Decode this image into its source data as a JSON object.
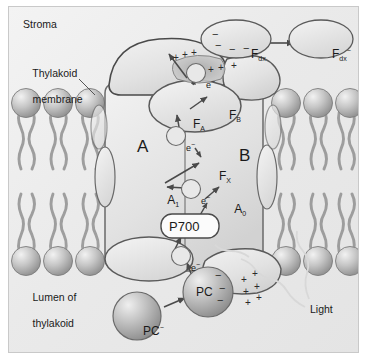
{
  "figure": {
    "type": "biological-diagram",
    "background_color": "#ebebeb",
    "frame_color": "#c9c9c9"
  },
  "region_labels": [
    {
      "id": "stroma",
      "text": "Stroma",
      "x": 14,
      "y": 18
    },
    {
      "id": "thylakoid-membrane",
      "line1": "Thylakoid",
      "line2": "membrane",
      "x": 6,
      "y": 53
    },
    {
      "id": "lumen",
      "line1": "Lumen of",
      "line2": "thylakoid",
      "x": 6,
      "y": 277
    },
    {
      "id": "light",
      "text": "Light",
      "x": 300,
      "y": 303
    }
  ],
  "subunits": [
    {
      "id": "subunit-a",
      "label": "A",
      "x": 131,
      "y": 139
    },
    {
      "id": "subunit-b",
      "label": "B",
      "x": 232,
      "y": 148
    }
  ],
  "cofactors": [
    {
      "id": "f-a",
      "base": "F",
      "sub": "A",
      "x": 170,
      "y": 101
    },
    {
      "id": "f-b",
      "base": "F",
      "sub": "B",
      "x": 206,
      "y": 93
    },
    {
      "id": "f-x",
      "base": "F",
      "sub": "X",
      "x": 196,
      "y": 154
    },
    {
      "id": "a1",
      "base": "A",
      "sub": "1",
      "x": 147,
      "y": 178
    },
    {
      "id": "a0",
      "base": "A",
      "sub": "0",
      "x": 212,
      "y": 187
    },
    {
      "id": "p700",
      "base": "P700",
      "sub": "",
      "x": 176,
      "y": 219
    }
  ],
  "mobile_carriers": [
    {
      "id": "fdx-oxidized",
      "base": "F",
      "sub": "dx",
      "sup": "",
      "charges": "− − − −",
      "cx": 227,
      "cy": 32
    },
    {
      "id": "fdx-reduced",
      "base": "F",
      "sub": "dx",
      "sup": "−",
      "charges": "",
      "cx": 312,
      "cy": 32
    },
    {
      "id": "pc-oxidized",
      "base": "PC",
      "sub": "",
      "sup": "",
      "charges": "− − −",
      "cx": 199,
      "cy": 285
    },
    {
      "id": "pc-reduced",
      "base": "PC",
      "sub": "",
      "sup": "−",
      "charges": "",
      "cx": 128,
      "cy": 309
    }
  ],
  "electrons": [
    {
      "id": "electron-top",
      "label": "e",
      "sup": "−",
      "cx": 187,
      "cy": 66
    },
    {
      "id": "electron-mid",
      "label": "e",
      "sup": "−",
      "cx": 167,
      "cy": 129
    },
    {
      "id": "electron-a1",
      "label": "e",
      "sup": "−",
      "cx": 182,
      "cy": 182
    },
    {
      "id": "electron-lumen",
      "label": "e",
      "sup": "−",
      "cx": 172,
      "cy": 249
    }
  ],
  "charge_marks": {
    "stromal_positive": "+ + + + +",
    "lumenal_positive": "+ + + + + +"
  },
  "colors": {
    "membrane_head": "#b9b9b9",
    "protein_fill": "#e6e6e6",
    "protein_stroke": "#6a6a6a",
    "sphere_fill": "#bdbdbd",
    "text": "#1a1a1a"
  }
}
